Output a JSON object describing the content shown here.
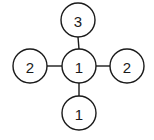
{
  "diagram": {
    "type": "cross-graph",
    "nodes": [
      {
        "id": "top",
        "label": "3",
        "cx": 78,
        "cy": 20,
        "r": 17
      },
      {
        "id": "left",
        "label": "2",
        "cx": 30,
        "cy": 66,
        "r": 17
      },
      {
        "id": "center",
        "label": "1",
        "cx": 79,
        "cy": 66,
        "r": 17
      },
      {
        "id": "right",
        "label": "2",
        "cx": 127,
        "cy": 66,
        "r": 17
      },
      {
        "id": "bottom",
        "label": "1",
        "cx": 79,
        "cy": 113,
        "r": 17
      }
    ],
    "edges": [
      {
        "from": "center",
        "to": "top"
      },
      {
        "from": "center",
        "to": "left"
      },
      {
        "from": "center",
        "to": "right"
      },
      {
        "from": "center",
        "to": "bottom"
      }
    ]
  }
}
